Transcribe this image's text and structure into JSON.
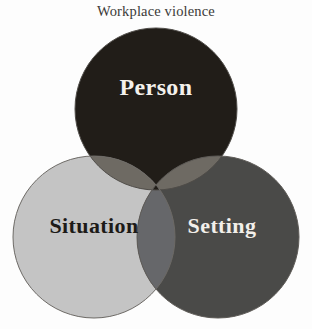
{
  "figure": {
    "title": "Workplace violence",
    "background_color": "#fdfdfd",
    "title_color": "#3b3a38"
  },
  "chart_data": {
    "type": "venn",
    "title": "Workplace violence",
    "xlabel": "",
    "ylabel": "",
    "sets": [
      {
        "name": "person",
        "label": "Person",
        "fill": "#211d18",
        "label_color": "#f4f1ec",
        "cx": 156,
        "cy": 109,
        "r": 81
      },
      {
        "name": "situation",
        "label": "Situation",
        "fill": "#c4c4c4",
        "label_color": "#1d1b18",
        "cx": 94,
        "cy": 237,
        "r": 81
      },
      {
        "name": "setting",
        "label": "Setting",
        "fill": "#4a4a48",
        "label_color": "#f2efea",
        "cx": 218,
        "cy": 237,
        "r": 81
      }
    ],
    "intersections": [
      {
        "name": "person-situation",
        "sets": [
          "Person",
          "Situation"
        ],
        "fill": "#6e6a63"
      },
      {
        "name": "person-setting",
        "sets": [
          "Person",
          "Setting"
        ],
        "fill": "#6e6a63"
      },
      {
        "name": "situation-setting",
        "sets": [
          "Situation",
          "Setting"
        ],
        "fill": "#66676a"
      },
      {
        "name": "person-situation-setting",
        "sets": [
          "Person",
          "Situation",
          "Setting"
        ],
        "fill": "#211d18"
      }
    ],
    "outline_color": "#53504c",
    "outline_width": 1,
    "grid": false,
    "legend": "none",
    "annotations": []
  }
}
